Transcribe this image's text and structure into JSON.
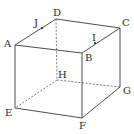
{
  "figure": {
    "type": "cube-perspective",
    "colors": {
      "line": "#3a3a3a",
      "hidden_line": "#5a5a5a",
      "background": "#ffffff"
    },
    "vertices": {
      "A": {
        "x": 15,
        "y": 45,
        "label": "A",
        "lx": 4,
        "ly": 47
      },
      "B": {
        "x": 82,
        "y": 53,
        "label": "B",
        "lx": 85,
        "ly": 61
      },
      "C": {
        "x": 120,
        "y": 28,
        "label": "C",
        "lx": 122,
        "ly": 26
      },
      "D": {
        "x": 56,
        "y": 19,
        "label": "D",
        "lx": 53,
        "ly": 16
      },
      "E": {
        "x": 15,
        "y": 108,
        "label": "E",
        "lx": 5,
        "ly": 116
      },
      "F": {
        "x": 82,
        "y": 118,
        "label": "F",
        "lx": 79,
        "ly": 129
      },
      "G": {
        "x": 120,
        "y": 87,
        "label": "G",
        "lx": 123,
        "ly": 94
      },
      "H": {
        "x": 57,
        "y": 80,
        "label": "H",
        "lx": 58,
        "ly": 78
      }
    },
    "points": {
      "J": {
        "x": 42,
        "y": 28,
        "label": "J",
        "lx": 34,
        "ly": 26,
        "on_edge": "AD"
      },
      "I": {
        "x": 95,
        "y": 43,
        "label": "I",
        "lx": 92,
        "ly": 41,
        "on_edge": "BC"
      }
    },
    "solid_edges": [
      "AB",
      "BC",
      "CD",
      "DA",
      "AE",
      "BF",
      "CG",
      "EF",
      "FG"
    ],
    "hidden_edges": [
      "DH",
      "HE",
      "HG"
    ],
    "labels": {
      "A": "A",
      "B": "B",
      "C": "C",
      "D": "D",
      "E": "E",
      "F": "F",
      "G": "G",
      "H": "H",
      "I": "I",
      "J": "J"
    }
  }
}
